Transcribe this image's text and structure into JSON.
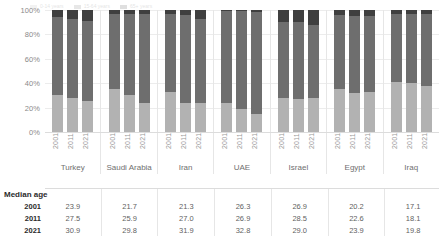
{
  "legend": {
    "items": [
      {
        "label": "0-14 years",
        "color": "#b2b2b2"
      },
      {
        "label": "15-64 years",
        "color": "#6e6e6e"
      },
      {
        "label": "65+ years",
        "color": "#3f3f3f"
      }
    ]
  },
  "axis": {
    "y_ticks": [
      "100%",
      "80%",
      "60%",
      "40%",
      "20%",
      "0%"
    ]
  },
  "table": {
    "title": "Median age",
    "row_labels": [
      "2001",
      "2011",
      "2021"
    ],
    "values": [
      [
        "23.9",
        "21.7",
        "21.3",
        "26.3",
        "26.9",
        "20.2",
        "17.1"
      ],
      [
        "27.5",
        "25.9",
        "27.0",
        "26.9",
        "28.5",
        "22.6",
        "18.1"
      ],
      [
        "30.9",
        "29.8",
        "31.9",
        "32.8",
        "29.0",
        "23.9",
        "19.8"
      ]
    ]
  },
  "chart_data": {
    "type": "bar",
    "subtype": "stacked-100-percent",
    "title": "",
    "xlabel": "",
    "ylabel": "",
    "ylim": [
      0,
      100
    ],
    "ytick_labels": [
      "0%",
      "20%",
      "40%",
      "60%",
      "80%",
      "100%"
    ],
    "grid": true,
    "legend_position": "top",
    "categories": [
      "Turkey",
      "Saudi Arabia",
      "Iran",
      "UAE",
      "Israel",
      "Egypt",
      "Iraq"
    ],
    "years": [
      "2001",
      "2011",
      "2021"
    ],
    "series": [
      {
        "name": "0-14 years",
        "color": "#b2b2b2",
        "values": {
          "Turkey": [
            30.0,
            28.0,
            25.0
          ],
          "Saudi Arabia": [
            35.0,
            30.0,
            24.0
          ],
          "Iran": [
            33.0,
            24.0,
            24.0
          ],
          "UAE": [
            24.0,
            19.0,
            15.0
          ],
          "Israel": [
            28.0,
            27.0,
            28.0
          ],
          "Egypt": [
            35.0,
            32.0,
            33.0
          ],
          "Iraq": [
            41.0,
            40.0,
            38.0
          ]
        }
      },
      {
        "name": "15-64 years",
        "color": "#6e6e6e",
        "values": {
          "Turkey": [
            64.0,
            65.0,
            66.0
          ],
          "Saudi Arabia": [
            62.0,
            67.0,
            73.0
          ],
          "Iran": [
            64.0,
            72.0,
            69.0
          ],
          "UAE": [
            75.0,
            80.0,
            83.0
          ],
          "Israel": [
            62.0,
            63.0,
            60.0
          ],
          "Egypt": [
            61.0,
            63.0,
            62.0
          ],
          "Iraq": [
            56.0,
            57.0,
            59.0
          ]
        }
      },
      {
        "name": "65+ years",
        "color": "#3f3f3f",
        "values": {
          "Turkey": [
            6.0,
            7.0,
            9.0
          ],
          "Saudi Arabia": [
            3.0,
            3.0,
            3.0
          ],
          "Iran": [
            3.0,
            4.0,
            7.0
          ],
          "UAE": [
            1.0,
            1.0,
            2.0
          ],
          "Israel": [
            10.0,
            10.0,
            12.0
          ],
          "Egypt": [
            4.0,
            5.0,
            5.0
          ],
          "Iraq": [
            3.0,
            3.0,
            3.0
          ]
        }
      }
    ],
    "median_age": {
      "label": "Median age",
      "years": [
        "2001",
        "2011",
        "2021"
      ],
      "Turkey": [
        23.9,
        27.5,
        30.9
      ],
      "Saudi Arabia": [
        21.7,
        25.9,
        29.8
      ],
      "Iran": [
        21.3,
        27.0,
        31.9
      ],
      "UAE": [
        26.3,
        26.9,
        32.8
      ],
      "Israel": [
        26.9,
        28.5,
        29.0
      ],
      "Egypt": [
        20.2,
        22.6,
        23.9
      ],
      "Iraq": [
        17.1,
        18.1,
        19.8
      ]
    }
  }
}
